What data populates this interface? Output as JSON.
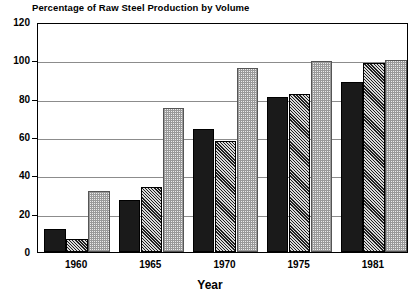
{
  "chart_data": {
    "type": "bar",
    "title": "Percentage of Raw Steel Production by Volume",
    "xlabel": "Year",
    "ylabel": "",
    "ylim": [
      0,
      120
    ],
    "yticks": [
      0,
      20,
      40,
      60,
      80,
      100,
      120
    ],
    "ytick_labels": [
      "0",
      "20",
      "40",
      "60",
      "80",
      "100",
      "120"
    ],
    "grid": true,
    "legend": "none",
    "categories": [
      "1960",
      "1965",
      "1970",
      "1975",
      "1981"
    ],
    "series": [
      {
        "name": "series-1",
        "fill": "solid-black",
        "values": [
          12,
          27,
          64,
          81,
          88.5
        ]
      },
      {
        "name": "series-2",
        "fill": "diagonal-hatch",
        "values": [
          7,
          34,
          58,
          82.5,
          98.5
        ]
      },
      {
        "name": "series-3",
        "fill": "light-dotted",
        "values": [
          32,
          75,
          96,
          99.5,
          100
        ]
      }
    ],
    "colors": {
      "series_1": "#1a1a1a",
      "series_2": "#d9d9d9",
      "series_3": "#ececec",
      "axis": "#000000",
      "grid": "#8c8c8c"
    }
  }
}
